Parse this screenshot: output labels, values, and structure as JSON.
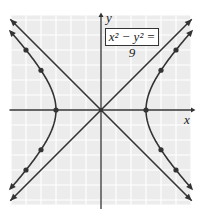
{
  "chart_data": {
    "type": "line",
    "xlabel": "x",
    "ylabel": "y",
    "xlim": [
      -6,
      6
    ],
    "ylim": [
      -6,
      6
    ],
    "grid": true,
    "series": [
      {
        "name": "hyperbola right branch",
        "points": [
          [
            3,
            0
          ],
          [
            4,
            2.65
          ],
          [
            4,
            -2.65
          ],
          [
            5,
            4
          ],
          [
            5,
            -4
          ]
        ]
      },
      {
        "name": "hyperbola left branch",
        "points": [
          [
            -3,
            0
          ],
          [
            -4,
            2.65
          ],
          [
            -4,
            -2.65
          ],
          [
            -5,
            4
          ],
          [
            -5,
            -4
          ]
        ]
      },
      {
        "name": "asymptote y=x",
        "points": [
          [
            -6,
            -6
          ],
          [
            6,
            6
          ]
        ]
      },
      {
        "name": "asymptote y=-x",
        "points": [
          [
            -6,
            6
          ],
          [
            6,
            -6
          ]
        ]
      }
    ],
    "annotations": [
      "x^2 - y^2 = 9"
    ]
  },
  "labels": {
    "x": "x",
    "y": "y",
    "equation": "x² − y² = 9"
  }
}
